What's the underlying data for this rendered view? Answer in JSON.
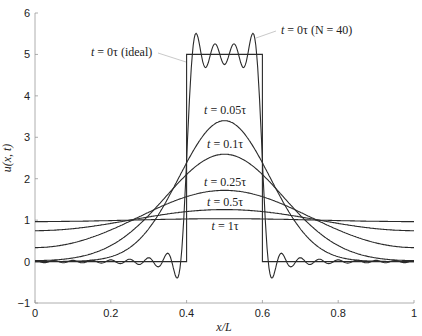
{
  "chart_data": {
    "type": "line",
    "title": "",
    "xlabel": "x/L",
    "ylabel": "u(x, t)",
    "xlim": [
      0,
      1
    ],
    "ylim": [
      -1,
      6
    ],
    "grid": false,
    "xticks": [
      0,
      0.2,
      0.4,
      0.6,
      0.8,
      1
    ],
    "xtick_labels": [
      "0",
      "0.2",
      "0.4",
      "0.6",
      "0.8",
      "1"
    ],
    "yticks": [
      -1,
      0,
      1,
      2,
      3,
      4,
      5,
      6
    ],
    "ytick_labels": [
      "−1",
      "0",
      "1",
      "2",
      "3",
      "4",
      "5",
      "6"
    ],
    "model": {
      "pulse_height": 5,
      "pulse_start": 0.4,
      "pulse_end": 0.6,
      "mean_value": 1,
      "series_terms_N": 40
    },
    "series": [
      {
        "name": "t = 0τ (ideal)",
        "t": null,
        "kind": "ideal",
        "x": [
          0,
          0.4,
          0.4,
          0.6,
          0.6,
          1
        ],
        "y": [
          0,
          0,
          5,
          5,
          0,
          0
        ]
      },
      {
        "name": "t = 0τ (N = 40)",
        "t": 0,
        "kind": "fourier",
        "x": [
          0,
          0.2,
          0.38,
          0.4,
          0.42,
          0.5,
          0.58,
          0.6,
          0.62,
          0.8,
          1
        ],
        "y": [
          0,
          0.02,
          -0.45,
          2.5,
          5.5,
          5.2,
          5.5,
          2.5,
          -0.45,
          0.02,
          0
        ]
      },
      {
        "name": "t = 0.05τ",
        "t": 0.05,
        "kind": "fourier",
        "x": [
          0,
          0.1,
          0.2,
          0.3,
          0.4,
          0.5,
          0.6,
          0.7,
          0.8,
          0.9,
          1
        ],
        "y": [
          0.0,
          0.01,
          0.13,
          0.9,
          2.6,
          3.4,
          2.6,
          0.9,
          0.13,
          0.01,
          0.0
        ]
      },
      {
        "name": "t = 0.1τ",
        "t": 0.1,
        "kind": "fourier",
        "x": [
          0,
          0.1,
          0.2,
          0.3,
          0.4,
          0.5,
          0.6,
          0.7,
          0.8,
          0.9,
          1
        ],
        "y": [
          0.03,
          0.1,
          0.45,
          1.25,
          2.2,
          2.6,
          2.2,
          1.25,
          0.45,
          0.1,
          0.03
        ]
      },
      {
        "name": "t = 0.25τ",
        "t": 0.25,
        "kind": "fourier",
        "x": [
          0,
          0.1,
          0.2,
          0.3,
          0.4,
          0.5,
          0.6,
          0.7,
          0.8,
          0.9,
          1
        ],
        "y": [
          0.35,
          0.45,
          0.75,
          1.15,
          1.55,
          1.75,
          1.55,
          1.15,
          0.75,
          0.45,
          0.35
        ]
      },
      {
        "name": "t = 0.5τ",
        "t": 0.5,
        "kind": "fourier",
        "x": [
          0,
          0.1,
          0.2,
          0.3,
          0.4,
          0.5,
          0.6,
          0.7,
          0.8,
          0.9,
          1
        ],
        "y": [
          0.76,
          0.8,
          0.9,
          1.05,
          1.18,
          1.24,
          1.18,
          1.05,
          0.9,
          0.8,
          0.76
        ]
      },
      {
        "name": "t = 1τ",
        "t": 1,
        "kind": "fourier",
        "x": [
          0,
          0.1,
          0.2,
          0.3,
          0.4,
          0.5,
          0.6,
          0.7,
          0.8,
          0.9,
          1
        ],
        "y": [
          0.97,
          0.97,
          0.98,
          1.0,
          1.02,
          1.03,
          1.02,
          1.0,
          0.98,
          0.97,
          0.97
        ]
      }
    ],
    "annotations": [
      {
        "text": "t = 0τ (ideal)",
        "x_px": 91,
        "y_px": 56,
        "anchor": "start",
        "leader": [
          158,
          53,
          186,
          62
        ]
      },
      {
        "text": "t = 0τ (N = 40)",
        "x_px": 281,
        "y_px": 34,
        "anchor": "start",
        "leader": [
          276,
          31,
          256,
          38
        ]
      },
      {
        "text": "t = 0.05τ",
        "x_px": 225,
        "y_px": 114,
        "anchor": "middle"
      },
      {
        "text": "t = 0.1τ",
        "x_px": 225,
        "y_px": 148,
        "anchor": "middle"
      },
      {
        "text": "t = 0.25τ",
        "x_px": 225,
        "y_px": 186,
        "anchor": "middle"
      },
      {
        "text": "t = 0.5τ",
        "x_px": 225,
        "y_px": 206,
        "anchor": "middle"
      },
      {
        "text": "t = 1τ",
        "x_px": 225,
        "y_px": 230,
        "anchor": "middle"
      }
    ],
    "legend": null
  }
}
